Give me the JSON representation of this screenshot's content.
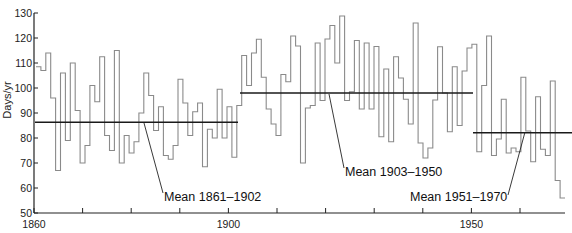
{
  "chart_data": {
    "type": "line",
    "style": "step",
    "title": "",
    "xlabel": "",
    "ylabel": "Days/yr",
    "xlim": [
      1860,
      1971
    ],
    "ylim": [
      50,
      130
    ],
    "grid": false,
    "legend": null,
    "x_ticks": [
      1860,
      1870,
      1880,
      1890,
      1900,
      1910,
      1920,
      1930,
      1940,
      1950,
      1960
    ],
    "x_tick_labels": [
      "1860",
      "",
      "",
      "",
      "1900",
      "",
      "",
      "",
      "",
      "1950",
      ""
    ],
    "y_ticks": [
      50,
      60,
      70,
      80,
      90,
      100,
      110,
      120,
      130
    ],
    "y_tick_labels": [
      "50",
      "60",
      "70",
      "80",
      "90",
      "100",
      "110",
      "120",
      "130"
    ],
    "series": [
      {
        "name": "Annual days",
        "start_year": 1860,
        "values": [
          108.5,
          107,
          114,
          96,
          67,
          106,
          79,
          110,
          91,
          70,
          77,
          101,
          94.5,
          112.5,
          81,
          75,
          115,
          70,
          81,
          74,
          78.5,
          90,
          106,
          97,
          83,
          92.5,
          73,
          71.5,
          77,
          103.5,
          94,
          81,
          90.5,
          94,
          68.5,
          83.5,
          80,
          99.5,
          80,
          92.5,
          72.3,
          93,
          113,
          101,
          114,
          119.5,
          104.3,
          91.6,
          85.6,
          81,
          105.4,
          102.5,
          120.8,
          116.8,
          70,
          92,
          93,
          118,
          95,
          119.6,
          125,
          110,
          128.8,
          95,
          98.5,
          119,
          91.6,
          118,
          91.6,
          116.6,
          80.5,
          107.6,
          78.5,
          112.5,
          104,
          95.5,
          85.6,
          126,
          78,
          72,
          76,
          95.2,
          116.5,
          98,
          82.5,
          108.5,
          85,
          106.8,
          116,
          117.5,
          74.5,
          101,
          120.8,
          73,
          79.6,
          95.5,
          74,
          76,
          74.5,
          104.3,
          82.8,
          70.5,
          96.5,
          75.5,
          73,
          102.8,
          63,
          56
        ]
      }
    ],
    "means": [
      {
        "label": "Mean 1861–1902",
        "value": 86.3,
        "from": 1860,
        "to": 1902
      },
      {
        "label": "Mean 1903–1950",
        "value": 98,
        "from": 1902.4,
        "to": 1950.5
      },
      {
        "label": "Mean 1951–1970",
        "value": 82.1,
        "from": 1950.5,
        "to": 1971
      }
    ],
    "annotations": [
      {
        "text": "Mean 1861–1902",
        "points_to_year": 1882.5
      },
      {
        "text": "Mean 1903–1950",
        "points_to_year": 1919.5
      },
      {
        "text": "Mean 1951–1970",
        "points_to_year": 1963.5
      }
    ]
  },
  "labels": {
    "ylabel": "Days/yr",
    "mean1": "Mean 1861–1902",
    "mean2": "Mean 1903–1950",
    "mean3": "Mean 1951–1970"
  },
  "colors": {
    "series": "#8a8a8a",
    "mean": "#1a1a1a",
    "axis": "#222222"
  }
}
